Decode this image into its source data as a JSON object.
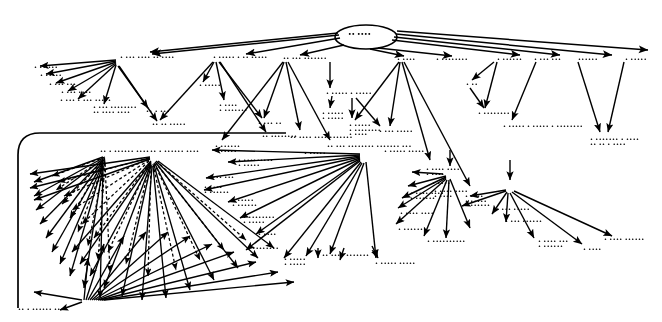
{
  "document": {
    "type": "scanned-diagram",
    "title": "Hierarchical node-link graph (degraded scan)",
    "background_color": "#ffffff",
    "ink_color": "#000000",
    "legible": false,
    "note": "All node captions are illegible in the source scan; rendered as smudged glyph runs."
  },
  "root": {
    "shape": "ellipse",
    "cx": 366,
    "cy": 37,
    "rx": 31,
    "ry": 12,
    "label": "•• ••••"
  },
  "group_box": {
    "shape": "rounded-rect",
    "x": 18,
    "y": 133,
    "width": 268,
    "height": 175,
    "radius": 22
  },
  "edge_styles": {
    "solid": "solid",
    "dashed": "dashed"
  },
  "nodes": [
    {
      "id": "n01",
      "x": 120,
      "y": 56,
      "label": "• ••• •••• •• ••••",
      "lines": 1
    },
    {
      "id": "n02",
      "x": 213,
      "y": 56,
      "label": "• ••••• • •• •••••",
      "lines": 1
    },
    {
      "id": "n03",
      "x": 283,
      "y": 57,
      "label": "•• ••• •••••••",
      "lines": 1
    },
    {
      "id": "n04",
      "x": 397,
      "y": 58,
      "label": "• ••••",
      "lines": 1
    },
    {
      "id": "n05",
      "x": 436,
      "y": 58,
      "label": "• ••••••••",
      "lines": 1
    },
    {
      "id": "n06",
      "x": 497,
      "y": 58,
      "label": "• ••••••",
      "lines": 1
    },
    {
      "id": "n07",
      "x": 534,
      "y": 58,
      "label": "• ••• •••",
      "lines": 1
    },
    {
      "id": "n08",
      "x": 578,
      "y": 58,
      "label": "••••••",
      "lines": 1
    },
    {
      "id": "n09",
      "x": 625,
      "y": 58,
      "label": "• •••••",
      "lines": 1
    },
    {
      "id": "n10",
      "x": 34,
      "y": 66,
      "label": "• •• •••",
      "lines": 1
    },
    {
      "id": "n11",
      "x": 40,
      "y": 74,
      "label": "• •••••",
      "lines": 1
    },
    {
      "id": "n12",
      "x": 49,
      "y": 83,
      "label": "• ••• •••",
      "lines": 1
    },
    {
      "id": "n13",
      "x": 61,
      "y": 91,
      "label": "• ••• ••••",
      "lines": 1
    },
    {
      "id": "n14",
      "x": 60,
      "y": 99,
      "label": "• ••• • ••• •••••",
      "lines": 1
    },
    {
      "id": "n15",
      "x": 93,
      "y": 106,
      "label": "• ••• ••••••••\n•• •••• ••••",
      "lines": 2
    },
    {
      "id": "n16",
      "x": 146,
      "y": 110,
      "label": "•• • •••",
      "lines": 1
    },
    {
      "id": "n17",
      "x": 152,
      "y": 123,
      "label": "•• •• •••••",
      "lines": 1
    },
    {
      "id": "n18",
      "x": 199,
      "y": 84,
      "label": "• •••••",
      "lines": 1
    },
    {
      "id": "n19",
      "x": 219,
      "y": 104,
      "label": "• ••••\n• •••••••",
      "lines": 2
    },
    {
      "id": "n20",
      "x": 258,
      "y": 122,
      "label": "• ••• ••",
      "lines": 1
    },
    {
      "id": "n21",
      "x": 262,
      "y": 135,
      "label": "•• ••••••••",
      "lines": 1
    },
    {
      "id": "n22",
      "x": 326,
      "y": 92,
      "label": "• ••••• • •••••",
      "lines": 1
    },
    {
      "id": "n23",
      "x": 322,
      "y": 112,
      "label": "• •••••\n• •••••",
      "lines": 2
    },
    {
      "id": "n24",
      "x": 349,
      "y": 124,
      "label": "• •••••\n• ••••••••\n• ••••",
      "lines": 3
    },
    {
      "id": "n25",
      "x": 379,
      "y": 130,
      "label": "• ••• •••••",
      "lines": 1
    },
    {
      "id": "n26",
      "x": 466,
      "y": 83,
      "label": "• •• ",
      "lines": 1
    },
    {
      "id": "n27",
      "x": 478,
      "y": 112,
      "label": "• ••••••••",
      "lines": 1
    },
    {
      "id": "n28",
      "x": 503,
      "y": 125,
      "label": "• ••••• • ••••• • ••••••••",
      "lines": 1
    },
    {
      "id": "n29",
      "x": 590,
      "y": 138,
      "label": "• ••••••• • ••••\n•• •• • ••••",
      "lines": 2
    },
    {
      "id": "n30",
      "x": 100,
      "y": 150,
      "label": "•• • •••••• ••••",
      "lines": 1
    },
    {
      "id": "n31",
      "x": 150,
      "y": 150,
      "label": "•• • •••••• ••••",
      "lines": 1
    },
    {
      "id": "n32",
      "x": 215,
      "y": 145,
      "label": "• ••••••\n• •••••",
      "lines": 2
    },
    {
      "id": "n33",
      "x": 238,
      "y": 159,
      "label": "• •••••••••\n• •••••",
      "lines": 2
    },
    {
      "id": "n34",
      "x": 207,
      "y": 176,
      "label": "• ••• •••",
      "lines": 1
    },
    {
      "id": "n35",
      "x": 204,
      "y": 186,
      "label": "• ••••\n• ••••••",
      "lines": 2
    },
    {
      "id": "n36",
      "x": 232,
      "y": 199,
      "label": "• •••••\n• ••••••",
      "lines": 2
    },
    {
      "id": "n37",
      "x": 243,
      "y": 216,
      "label": "• ••••••••\n• •••••",
      "lines": 2
    },
    {
      "id": "n38",
      "x": 258,
      "y": 233,
      "label": "• ••••",
      "lines": 1
    },
    {
      "id": "n39",
      "x": 247,
      "y": 247,
      "label": "• ••••••••",
      "lines": 1
    },
    {
      "id": "n40",
      "x": 290,
      "y": 136,
      "label": "•• •••• •••• •••••••",
      "lines": 1
    },
    {
      "id": "n41",
      "x": 327,
      "y": 145,
      "label": "•• ••• •••••••• ••••••• •••",
      "lines": 1
    },
    {
      "id": "n42",
      "x": 304,
      "y": 152,
      "label": "• •••••",
      "lines": 1
    },
    {
      "id": "n43",
      "x": 384,
      "y": 150,
      "label": "• ••••• •••••",
      "lines": 1
    },
    {
      "id": "n44",
      "x": 426,
      "y": 168,
      "label": "• •••• ••••\n• ••••",
      "lines": 2
    },
    {
      "id": "n45",
      "x": 410,
      "y": 192,
      "label": "• •••• ••••\n• ••••••",
      "lines": 2
    },
    {
      "id": "n46",
      "x": 400,
      "y": 212,
      "label": "• •••• ••••",
      "lines": 1
    },
    {
      "id": "n47",
      "x": 398,
      "y": 228,
      "label": "• ••••••",
      "lines": 1
    },
    {
      "id": "n48",
      "x": 427,
      "y": 240,
      "label": "• ••••••••••",
      "lines": 1
    },
    {
      "id": "n49",
      "x": 434,
      "y": 190,
      "label": "• •••• ••••\n• ••••",
      "lines": 2
    },
    {
      "id": "n50",
      "x": 465,
      "y": 195,
      "label": "• ••••\n• •••••\n• ••••••",
      "lines": 3
    },
    {
      "id": "n51",
      "x": 496,
      "y": 208,
      "label": "• ••• •••••",
      "lines": 1
    },
    {
      "id": "n52",
      "x": 505,
      "y": 220,
      "label": "• ••• ••••••",
      "lines": 1
    },
    {
      "id": "n53",
      "x": 538,
      "y": 240,
      "label": "• •••• •••\n• ••••••",
      "lines": 2
    },
    {
      "id": "n54",
      "x": 583,
      "y": 248,
      "label": "• ••••",
      "lines": 1
    },
    {
      "id": "n55",
      "x": 604,
      "y": 238,
      "label": "• •••• ••••••",
      "lines": 1
    },
    {
      "id": "n56",
      "x": 322,
      "y": 254,
      "label": "•• •••• •••••••",
      "lines": 1
    },
    {
      "id": "n57",
      "x": 284,
      "y": 258,
      "label": "• •••••\n• •••••",
      "lines": 2
    },
    {
      "id": "n58",
      "x": 375,
      "y": 262,
      "label": "• ••••• •••••",
      "lines": 1
    },
    {
      "id": "n59",
      "x": 18,
      "y": 308,
      "label": "•• • •••••• ••••",
      "lines": 1
    },
    {
      "id": "n60",
      "x": 432,
      "y": 182,
      "label": "• ••••",
      "lines": 1
    }
  ]
}
